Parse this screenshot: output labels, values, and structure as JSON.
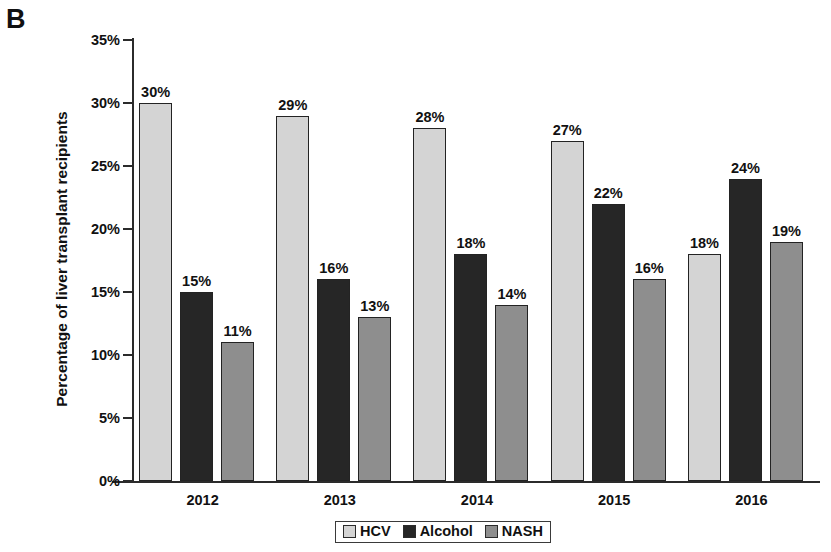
{
  "panel": {
    "letter": "B"
  },
  "chart_data": {
    "type": "bar",
    "title": "",
    "xlabel": "",
    "ylabel": "Percentage of liver transplant recipients",
    "ylim": [
      0,
      35
    ],
    "ytick_labels": [
      "0%",
      "5%",
      "10%",
      "15%",
      "20%",
      "25%",
      "30%",
      "35%"
    ],
    "ytick_values": [
      0,
      5,
      10,
      15,
      20,
      25,
      30,
      35
    ],
    "grid": false,
    "legend_position": "bottom",
    "categories": [
      "2012",
      "2013",
      "2014",
      "2015",
      "2016"
    ],
    "series": [
      {
        "name": "HCV",
        "color": "#d4d4d4",
        "values": [
          30,
          29,
          28,
          27,
          18
        ],
        "labels": [
          "30%",
          "29%",
          "28%",
          "27%",
          "18%"
        ]
      },
      {
        "name": "Alcohol",
        "color": "#262626",
        "values": [
          15,
          16,
          18,
          22,
          24
        ],
        "labels": [
          "15%",
          "16%",
          "18%",
          "22%",
          "24%"
        ]
      },
      {
        "name": "NASH",
        "color": "#8e8e8e",
        "values": [
          11,
          13,
          14,
          16,
          19
        ],
        "labels": [
          "11%",
          "13%",
          "14%",
          "16%",
          "19%"
        ]
      }
    ]
  },
  "legend": {
    "items": [
      {
        "label": "HCV",
        "color": "#d4d4d4"
      },
      {
        "label": "Alcohol",
        "color": "#262626"
      },
      {
        "label": "NASH",
        "color": "#8e8e8e"
      }
    ]
  }
}
